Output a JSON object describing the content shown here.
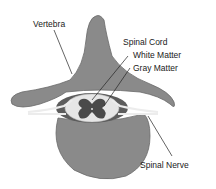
{
  "diagram": {
    "labels": {
      "vertebra": "Vertebra",
      "spinal_cord": "Spinal Cord",
      "white_matter": "White Matter",
      "gray_matter": "Gray Matter",
      "spinal_nerve": "Spinal Nerve"
    },
    "colors": {
      "bone": "#8a8a8a",
      "bone_dark": "#6f6f6f",
      "white_matter": "#e6e6e6",
      "gray_matter": "#4a4a4a",
      "nerve": "#ececec",
      "leader": "#222222"
    }
  }
}
